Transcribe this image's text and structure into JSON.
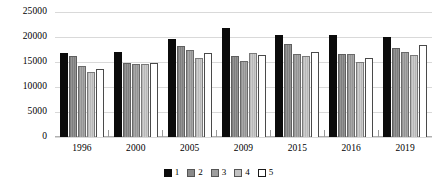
{
  "chart_data": {
    "type": "bar",
    "title": "",
    "subtitle": "",
    "xlabel": "",
    "ylabel": "",
    "categories": [
      "1996",
      "2000",
      "2005",
      "2009",
      "2015",
      "2016",
      "2019"
    ],
    "series": [
      {
        "name": "1",
        "color": "#0b0b0b",
        "values": [
          16900,
          17000,
          19700,
          21800,
          20500,
          20400,
          20100
        ]
      },
      {
        "name": "2",
        "color": "#8a8a8a",
        "values": [
          16300,
          14800,
          18300,
          16200,
          18700,
          16700,
          17900
        ]
      },
      {
        "name": "3",
        "color": "#9e9e9e",
        "values": [
          14300,
          14700,
          17400,
          15300,
          16600,
          16600,
          17000
        ]
      },
      {
        "name": "4",
        "color": "#c2c2c2",
        "values": [
          13100,
          14600,
          15900,
          16800,
          16300,
          15100,
          16400
        ]
      },
      {
        "name": "5",
        "color": "#ffffff",
        "values": [
          13700,
          14800,
          16900,
          16400,
          17000,
          15800,
          18400
        ]
      }
    ],
    "ylim": [
      0,
      25000
    ],
    "yticks": [
      0,
      5000,
      10000,
      15000,
      20000,
      25000
    ],
    "ytick_labels": [
      "0",
      "5000",
      "10000",
      "15000",
      "20000",
      "25000"
    ],
    "grid": true,
    "legend_position": "bottom",
    "legend_entries": [
      "1",
      "2",
      "3",
      "4",
      "5"
    ]
  }
}
